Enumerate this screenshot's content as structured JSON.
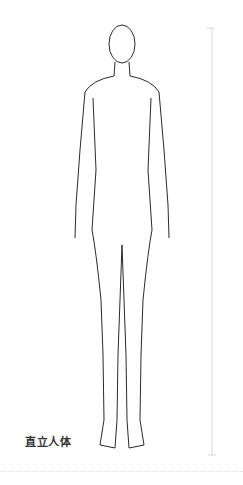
{
  "figure": {
    "caption": "直立人体",
    "line_color": "#2a2a2a",
    "measure_line_color": "#d8d8d8"
  }
}
